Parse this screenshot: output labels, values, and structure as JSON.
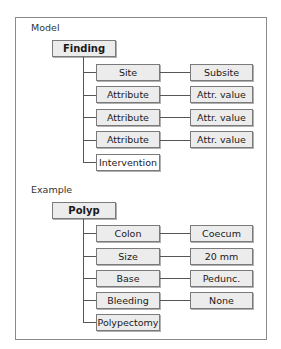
{
  "model": {
    "label": "Model",
    "root": "Finding",
    "rows": [
      {
        "left": "Site",
        "right": "Subsite"
      },
      {
        "left": "Attribute",
        "right": "Attr. value"
      },
      {
        "left": "Attribute",
        "right": "Attr. value"
      },
      {
        "left": "Attribute",
        "right": "Attr. value"
      },
      {
        "left": "Intervention",
        "right": null
      }
    ]
  },
  "example": {
    "label": "Example",
    "root": "Polyp",
    "rows": [
      {
        "left": "Colon",
        "right": "Coecum"
      },
      {
        "left": "Size",
        "right": "20 mm"
      },
      {
        "left": "Base",
        "right": "Pedunc."
      },
      {
        "left": "Bleeding",
        "right": "None"
      },
      {
        "left": "Polypectomy",
        "right": null
      }
    ]
  },
  "colors": {
    "box_fill": "#ececec",
    "box_border": "#7a7a7a",
    "frame_border": "#8a8a8a",
    "connector": "#555555"
  }
}
